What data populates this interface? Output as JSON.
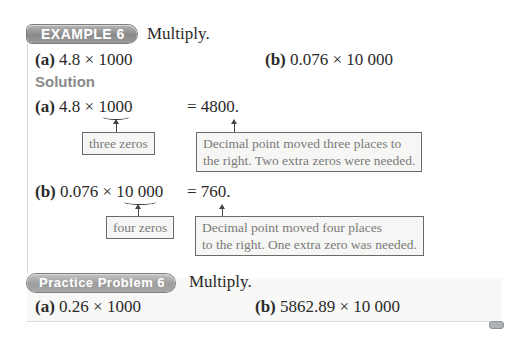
{
  "example": {
    "badge": "EXAMPLE 6",
    "instruction": "Multiply.",
    "problems": [
      {
        "label": "(a)",
        "expr": "4.8 × 1000"
      },
      {
        "label": "(b)",
        "expr": "0.076 × 10 000"
      }
    ]
  },
  "solution": {
    "heading": "Solution",
    "parts": [
      {
        "label": "(a)",
        "expr_pre": "4.8 × 1",
        "expr_zeros": "000",
        "result": "= 4800.",
        "zeros_note": "three zeros",
        "explanation_line1": "Decimal point moved three places to",
        "explanation_line2": "the right. Two extra zeros were needed."
      },
      {
        "label": "(b)",
        "expr_pre": "0.076 × 1",
        "expr_zeros": "0 000",
        "result": "= 760.",
        "zeros_note": "four zeros",
        "explanation_line1": "Decimal point moved four places",
        "explanation_line2": "to the right. One extra zero was needed."
      }
    ]
  },
  "practice": {
    "badge": "Practice Problem 6",
    "instruction": "Multiply.",
    "problems": [
      {
        "label": "(a)",
        "expr": "0.26 × 1000"
      },
      {
        "label": "(b)",
        "expr": "5862.89 × 10 000"
      }
    ]
  }
}
